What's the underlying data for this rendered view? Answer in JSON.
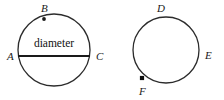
{
  "figure": {
    "background_color": "#ffffff",
    "stroke_color": "#2b2b2b",
    "label_color": "#1a1a1a",
    "width": 224,
    "height": 100,
    "caption": "Two circles: left circle with labeled diameter AC and point B on the arc; right circle with points D, E and F on its circumference"
  },
  "left_circle": {
    "name": "circle-with-diameter",
    "center_x": 54,
    "center_y": 50,
    "radius": 36,
    "stroke_width": 1.3,
    "diameter": {
      "label": "diameter",
      "label_x": 54,
      "label_y": 44,
      "x1": 18,
      "y1": 56,
      "x2": 90,
      "y2": 56,
      "stroke_width": 1.8
    },
    "points": [
      {
        "label": "A",
        "marker": "none",
        "cx": 18,
        "cy": 56,
        "label_x": 7,
        "label_y": 57
      },
      {
        "label": "B",
        "marker": "dot",
        "cx": 44,
        "cy": 19,
        "marker_r": 1.9,
        "label_x": 41,
        "label_y": 9
      },
      {
        "label": "C",
        "marker": "none",
        "cx": 90,
        "cy": 56,
        "label_x": 96,
        "label_y": 57
      }
    ]
  },
  "right_circle": {
    "name": "circle-with-three-points",
    "center_x": 166,
    "center_y": 50,
    "radius": 33,
    "stroke_width": 1.3,
    "points": [
      {
        "label": "D",
        "marker": "none",
        "cx": 160,
        "cy": 17,
        "label_x": 157,
        "label_y": 9
      },
      {
        "label": "E",
        "marker": "none",
        "cx": 199,
        "cy": 55,
        "label_x": 205,
        "label_y": 56
      },
      {
        "label": "F",
        "marker": "square",
        "cx": 142,
        "cy": 78,
        "marker_size": 4.2,
        "label_x": 139,
        "label_y": 92
      }
    ]
  }
}
